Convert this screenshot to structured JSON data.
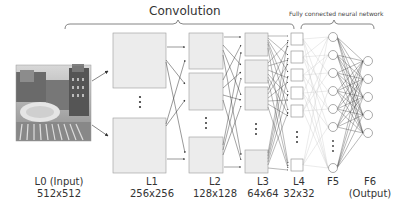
{
  "titles": {
    "convolution": "Convolution",
    "fully_connected": "Fully connected neural network"
  },
  "layers": [
    {
      "id": "L0",
      "name": "L0 (Input)",
      "size": "512x512"
    },
    {
      "id": "L1",
      "name": "L1",
      "size": "256x256"
    },
    {
      "id": "L2",
      "name": "L2",
      "size": "128x128"
    },
    {
      "id": "L3",
      "name": "L3",
      "size": "64x64"
    },
    {
      "id": "L4",
      "name": "L4",
      "size": "32x32"
    },
    {
      "id": "F5",
      "name": "F5",
      "size": ""
    },
    {
      "id": "F6",
      "name": "F6",
      "size": "(Output)"
    }
  ],
  "colors": {
    "box_fill": "#ececec",
    "box_stroke": "#9a9a9a",
    "line": "#333333",
    "light_line": "#bbbbbb",
    "text": "#333333"
  },
  "input_image": {
    "description": "photo of buildings and plaza",
    "icon": "photo-icon"
  }
}
